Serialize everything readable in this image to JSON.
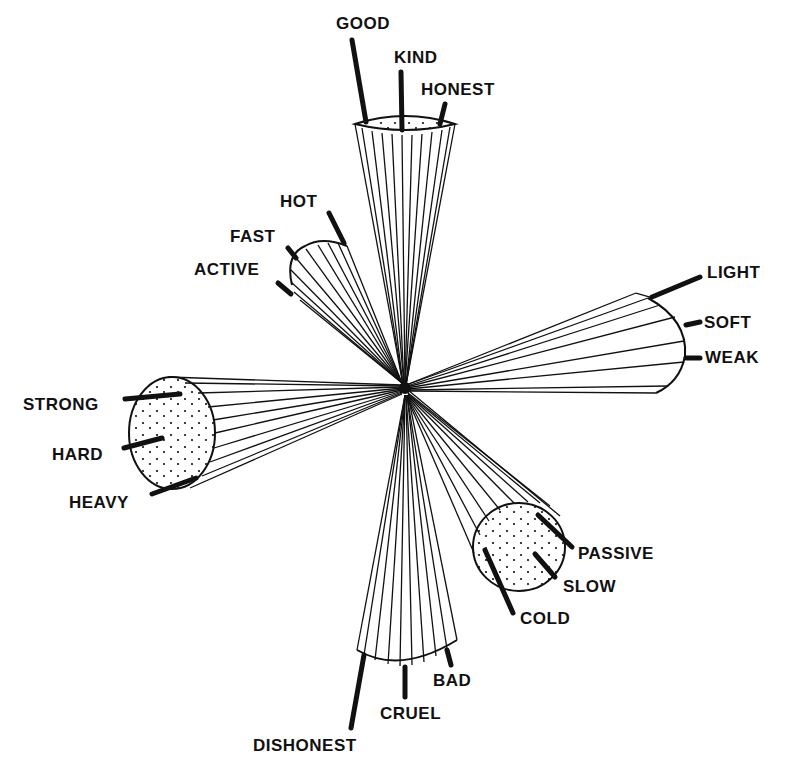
{
  "diagram": {
    "title": "",
    "center": {
      "x": 405,
      "y": 388
    },
    "cones": [
      {
        "id": "good",
        "direction": "up",
        "labels": [
          "GOOD",
          "KIND",
          "HONEST"
        ]
      },
      {
        "id": "active",
        "direction": "up-left",
        "labels": [
          "HOT",
          "FAST",
          "ACTIVE"
        ]
      },
      {
        "id": "light",
        "direction": "right",
        "labels": [
          "LIGHT",
          "SOFT",
          "WEAK"
        ]
      },
      {
        "id": "strong",
        "direction": "left",
        "labels": [
          "STRONG",
          "HARD",
          "HEAVY"
        ]
      },
      {
        "id": "passive",
        "direction": "down-right",
        "labels": [
          "PASSIVE",
          "SLOW",
          "COLD"
        ]
      },
      {
        "id": "bad",
        "direction": "down",
        "labels": [
          "BAD",
          "CRUEL",
          "DISHONEST"
        ]
      }
    ],
    "labels": {
      "good": "GOOD",
      "kind": "KIND",
      "honest": "HONEST",
      "hot": "HOT",
      "fast": "FAST",
      "active": "ACTIVE",
      "light": "LIGHT",
      "soft": "SOFT",
      "weak": "WEAK",
      "strong": "STRONG",
      "hard": "HARD",
      "heavy": "HEAVY",
      "passive": "PASSIVE",
      "slow": "SLOW",
      "cold": "COLD",
      "bad": "BAD",
      "cruel": "CRUEL",
      "dishonest": "DISHONEST"
    },
    "colors": {
      "ink": "#111111",
      "background": "#ffffff"
    }
  }
}
